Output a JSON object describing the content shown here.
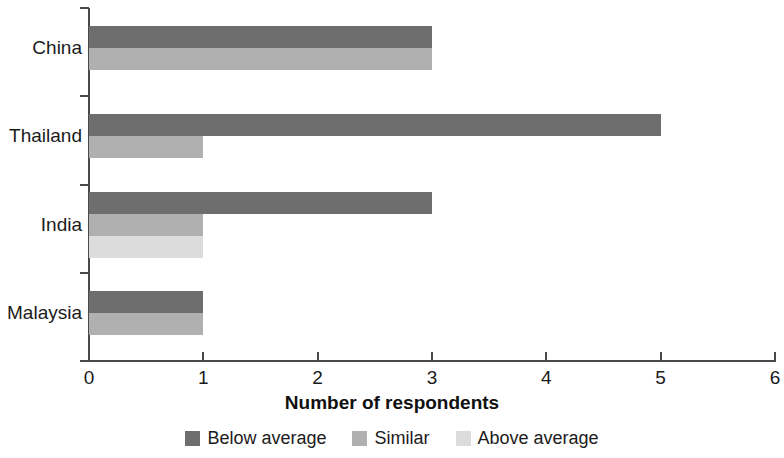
{
  "chart_data": {
    "type": "bar",
    "orientation": "horizontal",
    "title": "",
    "xlabel": "Number of respondents",
    "ylabel": "",
    "xlim": [
      0,
      6
    ],
    "xticks": [
      0,
      1,
      2,
      3,
      4,
      5,
      6
    ],
    "xtick_labels": [
      "0",
      "1",
      "2",
      "3",
      "4",
      "5",
      "6"
    ],
    "grid": false,
    "legend_position": "bottom",
    "categories": [
      "China",
      "Thailand",
      "India",
      "Malaysia"
    ],
    "series": [
      {
        "name": "Below average",
        "color": "#6e6e6e",
        "values": [
          3,
          5,
          3,
          1
        ]
      },
      {
        "name": "Similar",
        "color": "#b0b0b0",
        "values": [
          3,
          1,
          1,
          1
        ]
      },
      {
        "name": "Above average",
        "color": "#dcdcdc",
        "values": [
          0,
          0,
          1,
          0
        ]
      }
    ],
    "axis_color": "#4a4a4a",
    "background": "#ffffff"
  },
  "legend": {
    "items": [
      {
        "label": "Below average",
        "color": "#6e6e6e"
      },
      {
        "label": "Similar",
        "color": "#b0b0b0"
      },
      {
        "label": "Above average",
        "color": "#dcdcdc"
      }
    ]
  }
}
